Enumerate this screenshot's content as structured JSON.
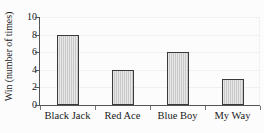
{
  "chart_data": {
    "type": "bar",
    "title": "",
    "xlabel": "",
    "ylabel": "Win (number of times)",
    "categories": [
      "Black Jack",
      "Red Ace",
      "Blue Boy",
      "My Way"
    ],
    "values": [
      8,
      4,
      6,
      3
    ],
    "ylim": [
      0,
      10
    ],
    "yticks": [
      0,
      2,
      4,
      6,
      8,
      10
    ],
    "ytick_labels": [
      "0",
      "2",
      "4",
      "6",
      "8",
      "10"
    ],
    "grid": true,
    "legend": false,
    "bar_fill_color": "#c9c9c9",
    "bar_border_color": "#3a3a3a",
    "axis_color": "#555555",
    "gridline_color": "#f0f0f0",
    "background_color": "#fcfcfc"
  }
}
